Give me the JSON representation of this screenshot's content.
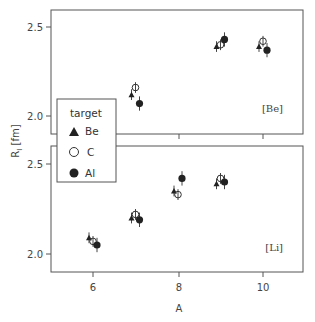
{
  "chart_data": {
    "type": "scatter",
    "title": "",
    "xlabel": "A",
    "ylabel": "R_I [fm]",
    "xlim": [
      5.2,
      11.2
    ],
    "x_ticks": [
      6,
      8,
      10
    ],
    "y_ticks": [
      2.0,
      2.5
    ],
    "grid": false,
    "legend": {
      "title": "target",
      "position": "left, overlapping both panels",
      "entries": [
        {
          "label": "Be",
          "marker": "filled-triangle"
        },
        {
          "label": "C",
          "marker": "open-circle"
        },
        {
          "label": "Al",
          "marker": "filled-circle"
        }
      ]
    },
    "panels": [
      {
        "tag": "[Be]",
        "ylim": [
          1.9,
          2.6
        ],
        "series": [
          {
            "name": "Be",
            "points": [
              {
                "x": 7,
                "y": 2.12,
                "err": 0.03
              },
              {
                "x": 9,
                "y": 2.39,
                "err": 0.03
              },
              {
                "x": 10,
                "y": 2.39,
                "err": 0.03
              }
            ]
          },
          {
            "name": "C",
            "points": [
              {
                "x": 7,
                "y": 2.16,
                "err": 0.03
              },
              {
                "x": 9,
                "y": 2.4,
                "err": 0.03
              },
              {
                "x": 10,
                "y": 2.42,
                "err": 0.03
              }
            ]
          },
          {
            "name": "Al",
            "points": [
              {
                "x": 7,
                "y": 2.07,
                "err": 0.04
              },
              {
                "x": 9,
                "y": 2.43,
                "err": 0.04
              },
              {
                "x": 10,
                "y": 2.37,
                "err": 0.04
              }
            ]
          }
        ]
      },
      {
        "tag": "[Li]",
        "ylim": [
          1.9,
          2.6
        ],
        "series": [
          {
            "name": "Be",
            "points": [
              {
                "x": 6,
                "y": 2.09,
                "err": 0.03
              },
              {
                "x": 7,
                "y": 2.2,
                "err": 0.03
              },
              {
                "x": 8,
                "y": 2.35,
                "err": 0.03
              },
              {
                "x": 9,
                "y": 2.39,
                "err": 0.03
              }
            ]
          },
          {
            "name": "C",
            "points": [
              {
                "x": 6,
                "y": 2.07,
                "err": 0.03
              },
              {
                "x": 7,
                "y": 2.22,
                "err": 0.03
              },
              {
                "x": 8,
                "y": 2.33,
                "err": 0.03
              },
              {
                "x": 9,
                "y": 2.42,
                "err": 0.03
              }
            ]
          },
          {
            "name": "Al",
            "points": [
              {
                "x": 6,
                "y": 2.05,
                "err": 0.04
              },
              {
                "x": 7,
                "y": 2.19,
                "err": 0.04
              },
              {
                "x": 8,
                "y": 2.42,
                "err": 0.04
              },
              {
                "x": 9,
                "y": 2.4,
                "err": 0.04
              }
            ]
          }
        ]
      }
    ]
  },
  "labels": {
    "xlabel": "A",
    "ylabel_main": "R",
    "ylabel_sub": "I",
    "ylabel_unit": " [fm]",
    "top_tag": "[Be]",
    "bottom_tag": "[Li]",
    "legend_title": "target",
    "legend_be": "Be",
    "legend_c": "C",
    "legend_al": "Al",
    "tick_y_top_25": "2.5",
    "tick_y_top_20": "2.0",
    "tick_y_bot_25": "2.5",
    "tick_y_bot_20": "2.0",
    "tick_x_6": "6",
    "tick_x_8": "8",
    "tick_x_10": "10"
  }
}
